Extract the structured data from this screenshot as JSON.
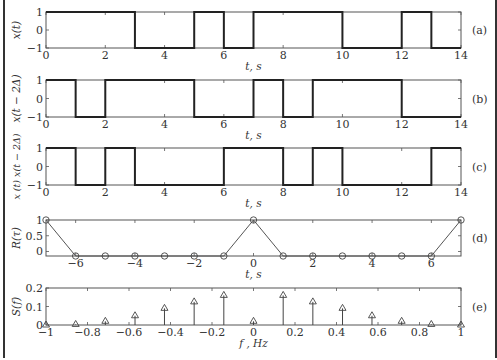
{
  "chart_data": [
    {
      "type": "line",
      "panel": "(a)",
      "ylabel": "x(t)",
      "xlabel": "t, s",
      "xlim": [
        0,
        14
      ],
      "ylim": [
        -1,
        1
      ],
      "xticks": [
        0,
        2,
        4,
        6,
        8,
        10,
        12,
        14
      ],
      "yticks": [
        -1,
        0,
        1
      ],
      "step": true,
      "x": [
        0,
        3,
        3,
        5,
        5,
        6,
        6,
        7,
        7,
        10,
        10,
        12,
        12,
        13,
        13,
        14
      ],
      "y": [
        1,
        1,
        -1,
        -1,
        1,
        1,
        -1,
        -1,
        1,
        1,
        -1,
        -1,
        1,
        1,
        -1,
        -1
      ]
    },
    {
      "type": "line",
      "panel": "(b)",
      "ylabel": "x(t − 2Δ)",
      "xlabel": "t, s",
      "xlim": [
        0,
        14
      ],
      "ylim": [
        -1,
        1
      ],
      "xticks": [
        0,
        2,
        4,
        6,
        8,
        10,
        12,
        14
      ],
      "yticks": [
        -1,
        0,
        1
      ],
      "step": true,
      "x": [
        0,
        1,
        1,
        2,
        2,
        5,
        5,
        7,
        7,
        8,
        8,
        9,
        9,
        12,
        12,
        14
      ],
      "y": [
        1,
        1,
        -1,
        -1,
        1,
        1,
        -1,
        -1,
        1,
        1,
        -1,
        -1,
        1,
        1,
        -1,
        -1
      ]
    },
    {
      "type": "line",
      "panel": "(c)",
      "ylabel": "x(t) x(t − 2Δ)",
      "xlabel": "t, s",
      "xlim": [
        0,
        14
      ],
      "ylim": [
        -1,
        1
      ],
      "xticks": [
        0,
        2,
        4,
        6,
        8,
        10,
        12,
        14
      ],
      "yticks": [
        -1,
        0,
        1
      ],
      "step": true,
      "x": [
        0,
        1,
        1,
        2,
        2,
        3,
        3,
        6,
        6,
        8,
        8,
        9,
        9,
        10,
        10,
        13,
        13,
        14
      ],
      "y": [
        1,
        1,
        -1,
        -1,
        1,
        1,
        -1,
        -1,
        1,
        1,
        -1,
        -1,
        1,
        1,
        -1,
        -1,
        1,
        1
      ]
    },
    {
      "type": "line",
      "panel": "(d)",
      "ylabel": "R(τ)",
      "xlabel": "t, s",
      "xlim": [
        -7,
        7
      ],
      "ylim": [
        -0.143,
        1
      ],
      "xticks": [
        -6,
        -4,
        -2,
        0,
        2,
        4,
        6
      ],
      "yticks": [
        0,
        0.5,
        1
      ],
      "markers": "circle",
      "x": [
        -7,
        -6,
        -5,
        -4,
        -3,
        -2,
        -1,
        0,
        1,
        2,
        3,
        4,
        5,
        6,
        7
      ],
      "y": [
        1,
        -0.143,
        -0.143,
        -0.143,
        -0.143,
        -0.143,
        -0.143,
        1,
        -0.143,
        -0.143,
        -0.143,
        -0.143,
        -0.143,
        -0.143,
        1
      ]
    },
    {
      "type": "stem",
      "panel": "(e)",
      "ylabel": "S(f)",
      "xlabel": "f, Hz",
      "xlim": [
        -1,
        1
      ],
      "ylim": [
        0,
        0.2
      ],
      "xticks": [
        -1,
        -0.8,
        -0.6,
        -0.4,
        -0.2,
        0,
        0.2,
        0.4,
        0.6,
        0.8,
        1
      ],
      "yticks": [
        0,
        0.1,
        0.2
      ],
      "markers": "triangle",
      "x": [
        -1,
        -0.857,
        -0.714,
        -0.571,
        -0.429,
        -0.286,
        -0.143,
        0,
        0.143,
        0.286,
        0.429,
        0.571,
        0.714,
        0.857,
        1
      ],
      "y": [
        0,
        0.003,
        0.02,
        0.05,
        0.09,
        0.125,
        0.16,
        0.02,
        0.16,
        0.125,
        0.09,
        0.05,
        0.02,
        0.003,
        0
      ]
    }
  ],
  "labels": {
    "a": {
      "panel": "(a)",
      "ylabel": "x(t)",
      "xlabel": "t, s"
    },
    "b": {
      "panel": "(b)",
      "ylabel": "x(t − 2Δ)",
      "xlabel": "t, s"
    },
    "c": {
      "panel": "(c)",
      "ylabel": "x (t) x(t − 2Δ)",
      "xlabel": "t, s"
    },
    "d": {
      "panel": "(d)",
      "ylabel": "R(τ)",
      "xlabel": "t, s"
    },
    "e": {
      "panel": "(e)",
      "ylabel": "S(f)",
      "xlabel": "f , Hz"
    }
  }
}
